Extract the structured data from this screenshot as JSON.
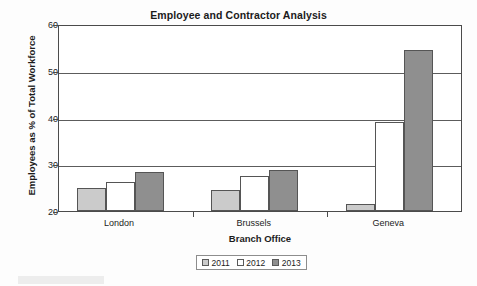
{
  "chart_data": {
    "type": "bar",
    "title": "Employee and Contractor Analysis",
    "xlabel": "Branch Office",
    "ylabel": "Employees as % of Total Workforce",
    "categories": [
      "London",
      "Brussels",
      "Geneva"
    ],
    "series": [
      {
        "name": "2011",
        "values": [
          24.9,
          24.4,
          21.4
        ],
        "color": "#cbcbcb"
      },
      {
        "name": "2012",
        "values": [
          26.3,
          27.4,
          39.0
        ],
        "color": "#ffffff"
      },
      {
        "name": "2013",
        "values": [
          28.3,
          28.7,
          54.5
        ],
        "color": "#8f8f8f"
      }
    ],
    "ylim": [
      20,
      60
    ],
    "yticks": [
      20,
      30,
      40,
      50,
      60
    ],
    "ytick_labels": [
      "20",
      "30",
      "40",
      "50",
      "60"
    ],
    "grid": true,
    "legend_position": "bottom",
    "legend_entries": [
      "2011",
      "2012",
      "2013"
    ]
  }
}
